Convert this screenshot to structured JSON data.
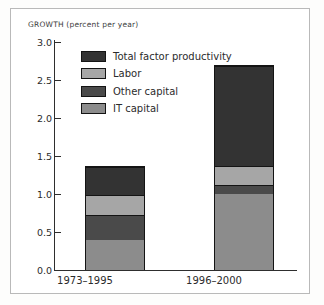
{
  "figure": {
    "axis_title": "GROWTH (percent per year)",
    "frame_color": "#b9b9b9",
    "background": "#ffffff"
  },
  "chart_data": {
    "type": "bar",
    "stacked": true,
    "title": "GROWTH (percent per year)",
    "xlabel": "",
    "ylabel": "GROWTH (percent per year)",
    "categories": [
      "1973–1995",
      "1996–2000"
    ],
    "ylim": [
      0.0,
      3.0
    ],
    "ytick_values": [
      0.0,
      0.5,
      1.0,
      1.5,
      2.0,
      2.5,
      3.0
    ],
    "ytick_labels": [
      "0.0",
      "0.5",
      "1.0",
      "1.5",
      "2.0",
      "2.5",
      "3.0"
    ],
    "grid": false,
    "legend_position": "inside-upper-left",
    "stack_order_bottom_to_top": [
      "IT capital",
      "Other capital",
      "Labor",
      "Total factor productivity"
    ],
    "series": [
      {
        "name": "IT capital",
        "color": "#8c8c8c",
        "values": [
          0.4,
          1.0
        ]
      },
      {
        "name": "Other capital",
        "color": "#4a4a4a",
        "values": [
          0.33,
          0.13
        ]
      },
      {
        "name": "Labor",
        "color": "#a6a6a6",
        "values": [
          0.27,
          0.24
        ]
      },
      {
        "name": "Total factor productivity",
        "color": "#333333",
        "values": [
          0.37,
          1.33
        ]
      }
    ],
    "totals": [
      1.37,
      2.7
    ]
  },
  "legend": {
    "items": [
      {
        "label": "Total factor productivity",
        "color": "#333333"
      },
      {
        "label": "Labor",
        "color": "#a6a6a6"
      },
      {
        "label": "Other capital",
        "color": "#4a4a4a"
      },
      {
        "label": "IT capital",
        "color": "#8c8c8c"
      }
    ]
  }
}
